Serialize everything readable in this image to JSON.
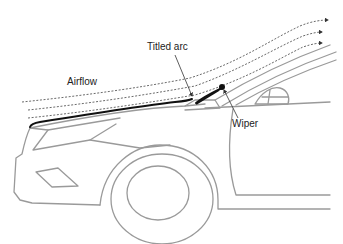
{
  "diagram": {
    "type": "annotated-illustration",
    "labels": {
      "airflow": "Airflow",
      "titled_arc": "Titled arc",
      "wiper": "Wiper"
    },
    "colors": {
      "background": "#ffffff",
      "car_outline": "#9a9a9a",
      "arc_line": "#111111",
      "airflow_lines": "#333333",
      "label_text": "#222222"
    },
    "airflow_streamline_count": 3
  }
}
